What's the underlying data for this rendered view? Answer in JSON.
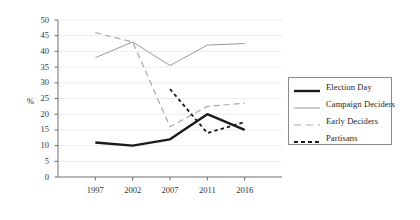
{
  "chart_data": {
    "type": "line",
    "title": "",
    "subtitle": "",
    "xlabel": "",
    "ylabel": "%",
    "categories": [
      "1997",
      "2002",
      "2007",
      "2011",
      "2016"
    ],
    "x_tick_labels": [
      "1997",
      "2002",
      "2007",
      "2011",
      "2016"
    ],
    "y_tick_labels": [
      "0",
      "5",
      "10",
      "15",
      "20",
      "25",
      "30",
      "35",
      "40",
      "45",
      "50"
    ],
    "y_ticks": [
      0,
      5,
      10,
      15,
      20,
      25,
      30,
      35,
      40,
      45,
      50
    ],
    "ylim": [
      0,
      50
    ],
    "grid": true,
    "grid_axis": "y",
    "legend_position": "right",
    "series": [
      {
        "name": "Election Day",
        "style": "solid-thick",
        "color": "#1a1a1a",
        "values": [
          11,
          10,
          12,
          20,
          15
        ]
      },
      {
        "name": "Campaign Deciders",
        "style": "solid-thin",
        "color": "#9a9a9a",
        "values": [
          38,
          43,
          35.5,
          42,
          42.5
        ]
      },
      {
        "name": "Early Deciders",
        "style": "dashed-long",
        "color": "#a8a8a8",
        "values": [
          46,
          43,
          16,
          22.5,
          23.5
        ]
      },
      {
        "name": "Partisans",
        "style": "dashed-short",
        "color": "#1a1a1a",
        "values": [
          null,
          null,
          28,
          14,
          17.5
        ]
      }
    ]
  },
  "legend": {
    "items": [
      {
        "label": "Election Day"
      },
      {
        "label": "Campaign Deciders"
      },
      {
        "label": "Early Deciders"
      },
      {
        "label": "Partisans"
      }
    ]
  }
}
